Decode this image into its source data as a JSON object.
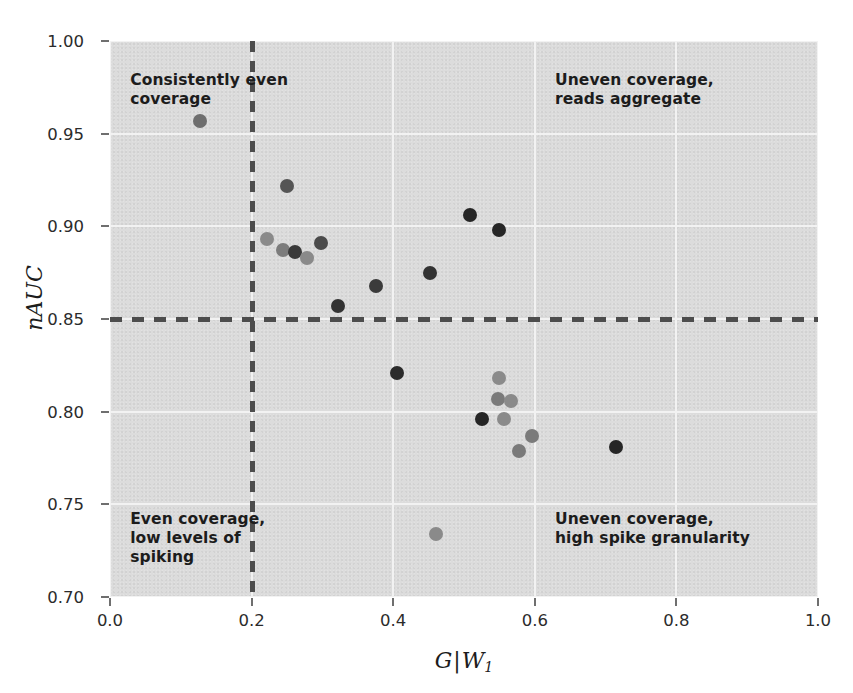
{
  "chart_data": {
    "type": "scatter",
    "title": "",
    "xlabel": "G|W1",
    "ylabel": "nAUC",
    "xlim": [
      0.0,
      1.0
    ],
    "ylim": [
      0.7,
      1.0
    ],
    "xticks": [
      "0.0",
      "0.2",
      "0.4",
      "0.6",
      "0.8",
      "1.0"
    ],
    "xtick_values": [
      0.0,
      0.2,
      0.4,
      0.6,
      0.8,
      1.0
    ],
    "yticks": [
      "0.70",
      "0.75",
      "0.80",
      "0.85",
      "0.90",
      "0.95",
      "1.00"
    ],
    "ytick_values": [
      0.7,
      0.75,
      0.8,
      0.85,
      0.9,
      0.95,
      1.0
    ],
    "grid": true,
    "legend": "none",
    "background": "#dcdcdc",
    "gridline_color": "#f2f2f2",
    "threshold_lines": [
      {
        "orientation": "vertical",
        "value": 0.2,
        "style": "dashed",
        "color": "#4d4d4d"
      },
      {
        "orientation": "horizontal",
        "value": 0.85,
        "style": "dashed",
        "color": "#4d4d4d"
      }
    ],
    "points": [
      {
        "x": 0.127,
        "y": 0.957,
        "color": "#6e6e6e",
        "r": 7
      },
      {
        "x": 0.25,
        "y": 0.922,
        "color": "#555555",
        "r": 7
      },
      {
        "x": 0.222,
        "y": 0.893,
        "color": "#8a8a8a",
        "r": 7
      },
      {
        "x": 0.245,
        "y": 0.887,
        "color": "#7c7c7c",
        "r": 7
      },
      {
        "x": 0.262,
        "y": 0.886,
        "color": "#3a3a3a",
        "r": 7
      },
      {
        "x": 0.278,
        "y": 0.883,
        "color": "#8a8a8a",
        "r": 7
      },
      {
        "x": 0.298,
        "y": 0.891,
        "color": "#4a4a4a",
        "r": 7
      },
      {
        "x": 0.322,
        "y": 0.857,
        "color": "#333333",
        "r": 7
      },
      {
        "x": 0.375,
        "y": 0.868,
        "color": "#3b3b3b",
        "r": 7
      },
      {
        "x": 0.452,
        "y": 0.875,
        "color": "#333333",
        "r": 7
      },
      {
        "x": 0.509,
        "y": 0.906,
        "color": "#262626",
        "r": 7
      },
      {
        "x": 0.55,
        "y": 0.898,
        "color": "#262626",
        "r": 7
      },
      {
        "x": 0.406,
        "y": 0.821,
        "color": "#2b2b2b",
        "r": 7
      },
      {
        "x": 0.55,
        "y": 0.818,
        "color": "#8a8a8a",
        "r": 7
      },
      {
        "x": 0.548,
        "y": 0.807,
        "color": "#7a7a7a",
        "r": 7
      },
      {
        "x": 0.566,
        "y": 0.806,
        "color": "#8a8a8a",
        "r": 7
      },
      {
        "x": 0.525,
        "y": 0.796,
        "color": "#262626",
        "r": 7
      },
      {
        "x": 0.556,
        "y": 0.796,
        "color": "#8a8a8a",
        "r": 7
      },
      {
        "x": 0.596,
        "y": 0.787,
        "color": "#7a7a7a",
        "r": 7
      },
      {
        "x": 0.578,
        "y": 0.779,
        "color": "#7a7a7a",
        "r": 7
      },
      {
        "x": 0.714,
        "y": 0.781,
        "color": "#262626",
        "r": 7
      },
      {
        "x": 0.461,
        "y": 0.734,
        "color": "#8a8a8a",
        "r": 7
      }
    ],
    "annotations": [
      {
        "id": "top-left",
        "text": "Consistently even\ncoverage",
        "x": 0.02,
        "y": 0.985
      },
      {
        "id": "top-right",
        "text": "Uneven coverage,\nreads aggregate",
        "x": 0.62,
        "y": 0.985
      },
      {
        "id": "bottom-left",
        "text": "Even coverage,\nlow levels of\nspiking",
        "x": 0.02,
        "y": 0.748
      },
      {
        "id": "bottom-right",
        "text": "Uneven coverage,\nhigh spike granularity",
        "x": 0.62,
        "y": 0.748
      }
    ]
  }
}
